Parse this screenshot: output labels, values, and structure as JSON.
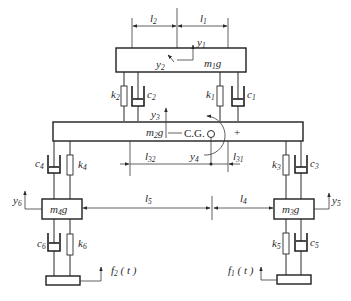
{
  "diagram": {
    "title": "",
    "masses": {
      "m1": {
        "label": "m",
        "sub": "1",
        "suffix": "g"
      },
      "m2": {
        "label": "m",
        "sub": "2",
        "suffix": "g"
      },
      "m3": {
        "label": "m",
        "sub": "3",
        "suffix": "g"
      },
      "m4": {
        "label": "m",
        "sub": "4",
        "suffix": "g"
      }
    },
    "springs": {
      "k1": {
        "label": "k",
        "sub": "1"
      },
      "k2": {
        "label": "k",
        "sub": "2"
      },
      "k3_top": {
        "label": "k",
        "sub": "3"
      },
      "k4": {
        "label": "k",
        "sub": "4"
      },
      "k3_right": {
        "label": "k",
        "sub": "3"
      },
      "k5": {
        "label": "k",
        "sub": "5"
      },
      "k6": {
        "label": "k",
        "sub": "6"
      }
    },
    "dampers": {
      "c1": {
        "label": "c",
        "sub": "1"
      },
      "c2": {
        "label": "c",
        "sub": "2"
      },
      "c3": {
        "label": "c",
        "sub": "3"
      },
      "c4": {
        "label": "c",
        "sub": "4"
      },
      "c5": {
        "label": "c",
        "sub": "5"
      },
      "c6": {
        "label": "c",
        "sub": "6"
      }
    },
    "displacements": {
      "y1": {
        "label": "y",
        "sub": "1"
      },
      "y2": {
        "label": "y",
        "sub": "2"
      },
      "y3": {
        "label": "y",
        "sub": "3"
      },
      "y4": {
        "label": "y",
        "sub": "4"
      },
      "y5": {
        "label": "y",
        "sub": "5"
      },
      "y6": {
        "label": "y",
        "sub": "6"
      }
    },
    "dimensions": {
      "l1": {
        "label": "l",
        "sub": "1"
      },
      "l2": {
        "label": "l",
        "sub": "2"
      },
      "l31": {
        "label": "l",
        "sub": "31"
      },
      "l32": {
        "label": "l",
        "sub": "32"
      },
      "l4": {
        "label": "l",
        "sub": "4"
      },
      "l5": {
        "label": "l",
        "sub": "5"
      }
    },
    "forces": {
      "f1": {
        "label": "f",
        "sub": "1",
        "arg": " ( t )"
      },
      "f2": {
        "label": "f",
        "sub": "2",
        "arg": " ( t )"
      }
    },
    "cg_label": "C.G.",
    "rotation_sign": "+"
  }
}
